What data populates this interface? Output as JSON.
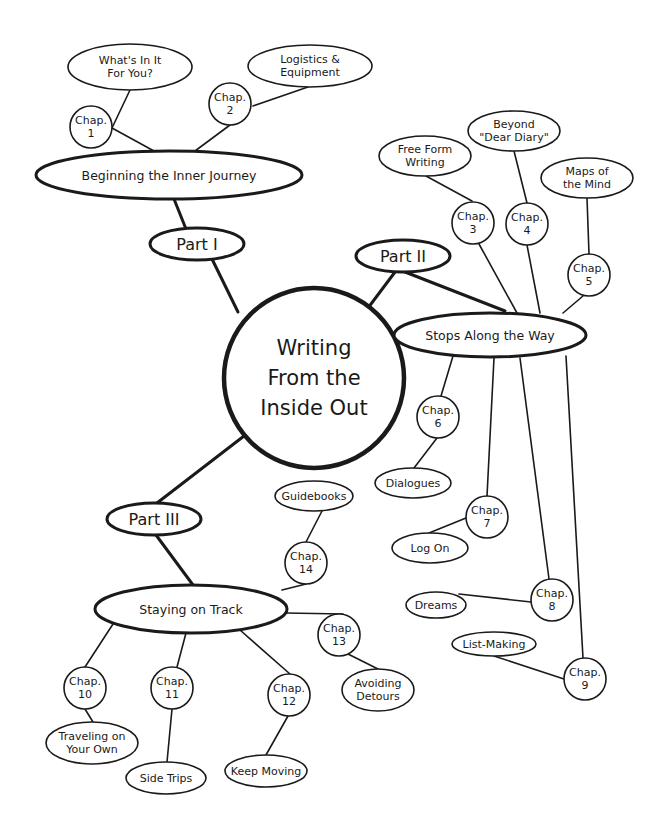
{
  "diagram": {
    "center": {
      "id": "center",
      "lines": [
        "Writing",
        "From the",
        "Inside Out"
      ],
      "shape": "circle",
      "cx": 314,
      "cy": 378,
      "r": 90
    },
    "nodes": [
      {
        "id": "part1",
        "lines": [
          "Part I"
        ],
        "shape": "ellipse",
        "cx": 197,
        "cy": 244,
        "rx": 47,
        "ry": 16,
        "weight": "med",
        "size": "l"
      },
      {
        "id": "part2",
        "lines": [
          "Part II"
        ],
        "shape": "ellipse",
        "cx": 403,
        "cy": 256,
        "rx": 47,
        "ry": 16,
        "weight": "med",
        "size": "l"
      },
      {
        "id": "part3",
        "lines": [
          "Part III"
        ],
        "shape": "ellipse",
        "cx": 154,
        "cy": 519,
        "rx": 47,
        "ry": 16,
        "weight": "med",
        "size": "l"
      },
      {
        "id": "sec1",
        "lines": [
          "Beginning the Inner Journey"
        ],
        "shape": "ellipse",
        "cx": 169,
        "cy": 175,
        "rx": 133,
        "ry": 24,
        "weight": "med",
        "size": "m"
      },
      {
        "id": "sec2",
        "lines": [
          "Stops Along the Way"
        ],
        "shape": "ellipse",
        "cx": 490,
        "cy": 335,
        "rx": 96,
        "ry": 22,
        "weight": "med",
        "size": "m"
      },
      {
        "id": "sec3",
        "lines": [
          "Staying on Track"
        ],
        "shape": "ellipse",
        "cx": 191,
        "cy": 609,
        "rx": 96,
        "ry": 24,
        "weight": "med",
        "size": "m"
      },
      {
        "id": "ch1",
        "lines": [
          "Chap.",
          "1"
        ],
        "shape": "circle",
        "cx": 91,
        "cy": 127,
        "r": 21,
        "weight": "thin",
        "size": "s"
      },
      {
        "id": "ch2",
        "lines": [
          "Chap.",
          "2"
        ],
        "shape": "circle",
        "cx": 230,
        "cy": 104,
        "r": 21,
        "weight": "thin",
        "size": "s"
      },
      {
        "id": "ch3",
        "lines": [
          "Chap.",
          "3"
        ],
        "shape": "circle",
        "cx": 473,
        "cy": 223,
        "r": 21,
        "weight": "thin",
        "size": "s"
      },
      {
        "id": "ch4",
        "lines": [
          "Chap.",
          "4"
        ],
        "shape": "circle",
        "cx": 527,
        "cy": 224,
        "r": 21,
        "weight": "thin",
        "size": "s"
      },
      {
        "id": "ch5",
        "lines": [
          "Chap.",
          "5"
        ],
        "shape": "circle",
        "cx": 589,
        "cy": 275,
        "r": 21,
        "weight": "thin",
        "size": "s"
      },
      {
        "id": "ch6",
        "lines": [
          "Chap.",
          "6"
        ],
        "shape": "circle",
        "cx": 438,
        "cy": 417,
        "r": 21,
        "weight": "thin",
        "size": "s"
      },
      {
        "id": "ch7",
        "lines": [
          "Chap.",
          "7"
        ],
        "shape": "circle",
        "cx": 487,
        "cy": 517,
        "r": 21,
        "weight": "thin",
        "size": "s"
      },
      {
        "id": "ch8",
        "lines": [
          "Chap.",
          "8"
        ],
        "shape": "circle",
        "cx": 552,
        "cy": 600,
        "r": 21,
        "weight": "thin",
        "size": "s"
      },
      {
        "id": "ch9",
        "lines": [
          "Chap.",
          "9"
        ],
        "shape": "circle",
        "cx": 585,
        "cy": 679,
        "r": 21,
        "weight": "thin",
        "size": "s"
      },
      {
        "id": "ch10",
        "lines": [
          "Chap.",
          "10"
        ],
        "shape": "circle",
        "cx": 85,
        "cy": 688,
        "r": 21,
        "weight": "thin",
        "size": "s"
      },
      {
        "id": "ch11",
        "lines": [
          "Chap.",
          "11"
        ],
        "shape": "circle",
        "cx": 172,
        "cy": 688,
        "r": 21,
        "weight": "thin",
        "size": "s"
      },
      {
        "id": "ch12",
        "lines": [
          "Chap.",
          "12"
        ],
        "shape": "circle",
        "cx": 289,
        "cy": 695,
        "r": 21,
        "weight": "thin",
        "size": "s"
      },
      {
        "id": "ch13",
        "lines": [
          "Chap.",
          "13"
        ],
        "shape": "circle",
        "cx": 339,
        "cy": 635,
        "r": 21,
        "weight": "thin",
        "size": "s"
      },
      {
        "id": "ch14",
        "lines": [
          "Chap.",
          "14"
        ],
        "shape": "circle",
        "cx": 306,
        "cy": 563,
        "r": 21,
        "weight": "thin",
        "size": "s"
      },
      {
        "id": "t1",
        "lines": [
          "What's In It",
          "For You?"
        ],
        "shape": "ellipse",
        "cx": 130,
        "cy": 67,
        "rx": 62,
        "ry": 23,
        "weight": "thin",
        "size": "s"
      },
      {
        "id": "t2",
        "lines": [
          "Logistics &",
          "Equipment"
        ],
        "shape": "ellipse",
        "cx": 310,
        "cy": 66,
        "rx": 62,
        "ry": 21,
        "weight": "thin",
        "size": "s"
      },
      {
        "id": "t3",
        "lines": [
          "Free Form",
          "Writing"
        ],
        "shape": "ellipse",
        "cx": 425,
        "cy": 156,
        "rx": 46,
        "ry": 20,
        "weight": "thin",
        "size": "s"
      },
      {
        "id": "t4",
        "lines": [
          "Beyond",
          "\"Dear Diary\""
        ],
        "shape": "ellipse",
        "cx": 514,
        "cy": 131,
        "rx": 46,
        "ry": 20,
        "weight": "thin",
        "size": "s"
      },
      {
        "id": "t5",
        "lines": [
          "Maps of",
          "the Mind"
        ],
        "shape": "ellipse",
        "cx": 587,
        "cy": 178,
        "rx": 46,
        "ry": 20,
        "weight": "thin",
        "size": "s"
      },
      {
        "id": "t6",
        "lines": [
          "Dialogues"
        ],
        "shape": "ellipse",
        "cx": 413,
        "cy": 483,
        "rx": 38,
        "ry": 15,
        "weight": "thin",
        "size": "s"
      },
      {
        "id": "t7",
        "lines": [
          "Log On"
        ],
        "shape": "ellipse",
        "cx": 430,
        "cy": 548,
        "rx": 38,
        "ry": 15,
        "weight": "thin",
        "size": "s"
      },
      {
        "id": "t8",
        "lines": [
          "Dreams"
        ],
        "shape": "ellipse",
        "cx": 436,
        "cy": 605,
        "rx": 30,
        "ry": 13,
        "weight": "thin",
        "size": "s"
      },
      {
        "id": "t9",
        "lines": [
          "List-Making"
        ],
        "shape": "ellipse",
        "cx": 494,
        "cy": 644,
        "rx": 42,
        "ry": 12,
        "weight": "thin",
        "size": "s"
      },
      {
        "id": "t10",
        "lines": [
          "Traveling on",
          "Your Own"
        ],
        "shape": "ellipse",
        "cx": 92,
        "cy": 743,
        "rx": 46,
        "ry": 21,
        "weight": "thin",
        "size": "s"
      },
      {
        "id": "t11",
        "lines": [
          "Side Trips"
        ],
        "shape": "ellipse",
        "cx": 166,
        "cy": 778,
        "rx": 40,
        "ry": 16,
        "weight": "thin",
        "size": "s"
      },
      {
        "id": "t12",
        "lines": [
          "Keep Moving"
        ],
        "shape": "ellipse",
        "cx": 266,
        "cy": 771,
        "rx": 41,
        "ry": 16,
        "weight": "thin",
        "size": "s"
      },
      {
        "id": "t13",
        "lines": [
          "Avoiding",
          "Detours"
        ],
        "shape": "ellipse",
        "cx": 378,
        "cy": 690,
        "rx": 36,
        "ry": 21,
        "weight": "thin",
        "size": "s"
      },
      {
        "id": "t14",
        "lines": [
          "Guidebooks"
        ],
        "shape": "ellipse",
        "cx": 314,
        "cy": 496,
        "rx": 39,
        "ry": 15,
        "weight": "thin",
        "size": "s"
      }
    ],
    "edges": [
      {
        "points": [
          [
            238,
            312
          ],
          [
            212,
            259
          ]
        ],
        "weight": "thick"
      },
      {
        "points": [
          [
            186,
            229
          ],
          [
            174,
            199
          ]
        ],
        "weight": "thick"
      },
      {
        "points": [
          [
            362,
            316
          ],
          [
            395,
            272
          ]
        ],
        "weight": "thick"
      },
      {
        "points": [
          [
            405,
            272
          ],
          [
            505,
            311
          ]
        ],
        "weight": "thick"
      },
      {
        "points": [
          [
            244,
            436
          ],
          [
            157,
            503
          ]
        ],
        "weight": "thick"
      },
      {
        "points": [
          [
            156,
            535
          ],
          [
            193,
            585
          ]
        ],
        "weight": "thick"
      },
      {
        "points": [
          [
            154,
            151
          ],
          [
            112,
            128
          ]
        ],
        "weight": "thin"
      },
      {
        "points": [
          [
            112,
            128
          ],
          [
            130,
            90
          ]
        ],
        "weight": "thin"
      },
      {
        "points": [
          [
            195,
            151
          ],
          [
            230,
            125
          ]
        ],
        "weight": "thin"
      },
      {
        "points": [
          [
            253,
            106
          ],
          [
            308,
            87
          ]
        ],
        "weight": "thin"
      },
      {
        "points": [
          [
            479,
            244
          ],
          [
            517,
            313
          ]
        ],
        "weight": "thin"
      },
      {
        "points": [
          [
            472,
            201
          ],
          [
            426,
            176
          ]
        ],
        "weight": "thin"
      },
      {
        "points": [
          [
            527,
            245
          ],
          [
            540,
            313
          ]
        ],
        "weight": "thin"
      },
      {
        "points": [
          [
            527,
            203
          ],
          [
            514,
            151
          ]
        ],
        "weight": "thin"
      },
      {
        "points": [
          [
            583,
            296
          ],
          [
            563,
            313
          ]
        ],
        "weight": "thin"
      },
      {
        "points": [
          [
            589,
            254
          ],
          [
            587,
            198
          ]
        ],
        "weight": "thin"
      },
      {
        "points": [
          [
            453,
            356
          ],
          [
            441,
            396
          ]
        ],
        "weight": "thin"
      },
      {
        "points": [
          [
            437,
            438
          ],
          [
            414,
            468
          ]
        ],
        "weight": "thin"
      },
      {
        "points": [
          [
            494,
            358
          ],
          [
            487,
            496
          ]
        ],
        "weight": "thin"
      },
      {
        "points": [
          [
            466,
            518
          ],
          [
            429,
            533
          ]
        ],
        "weight": "thin"
      },
      {
        "points": [
          [
            520,
            358
          ],
          [
            549,
            579
          ]
        ],
        "weight": "thin"
      },
      {
        "points": [
          [
            531,
            602
          ],
          [
            459,
            594
          ]
        ],
        "weight": "thin"
      },
      {
        "points": [
          [
            566,
            356
          ],
          [
            583,
            658
          ]
        ],
        "weight": "thin"
      },
      {
        "points": [
          [
            564,
            679
          ],
          [
            494,
            656
          ]
        ],
        "weight": "thin"
      },
      {
        "points": [
          [
            113,
            624
          ],
          [
            85,
            667
          ]
        ],
        "weight": "thin"
      },
      {
        "points": [
          [
            85,
            709
          ],
          [
            93,
            722
          ]
        ],
        "weight": "thin"
      },
      {
        "points": [
          [
            186,
            633
          ],
          [
            177,
            667
          ]
        ],
        "weight": "thin"
      },
      {
        "points": [
          [
            172,
            709
          ],
          [
            167,
            762
          ]
        ],
        "weight": "thin"
      },
      {
        "points": [
          [
            240,
            630
          ],
          [
            290,
            674
          ]
        ],
        "weight": "thin"
      },
      {
        "points": [
          [
            288,
            716
          ],
          [
            266,
            755
          ]
        ],
        "weight": "thin"
      },
      {
        "points": [
          [
            286,
            613
          ],
          [
            343,
            614
          ]
        ],
        "weight": "thin"
      },
      {
        "points": [
          [
            348,
            654
          ],
          [
            378,
            669
          ]
        ],
        "weight": "thin"
      },
      {
        "points": [
          [
            282,
            590
          ],
          [
            306,
            584
          ]
        ],
        "weight": "thin"
      },
      {
        "points": [
          [
            306,
            542
          ],
          [
            322,
            511
          ]
        ],
        "weight": "thin"
      }
    ]
  }
}
